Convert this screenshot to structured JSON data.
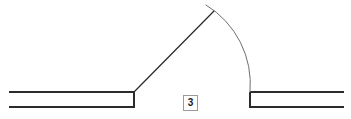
{
  "drawing": {
    "title": "Angular dimension detail",
    "canvas": {
      "width": 351,
      "height": 119,
      "background": "#ffffff"
    },
    "stroke_colors": {
      "outline": "#2b2b2b",
      "arc": "#6e6e6e",
      "label_border": "#9a9a9a",
      "label_text": "#1a1a1a"
    },
    "labels": [
      {
        "id": "angle-dimension",
        "text": "3",
        "x": 183,
        "y": 95,
        "w": 15,
        "h": 16
      }
    ],
    "geometry": {
      "left_band": {
        "name": "left-horizontal-band",
        "top_line": {
          "x1": 9,
          "y1": 92,
          "x2": 134,
          "y2": 92
        },
        "bottom_line": {
          "x1": 9,
          "y1": 107,
          "x2": 134,
          "y2": 107
        },
        "end_cap": {
          "x1": 134,
          "y1": 92,
          "x2": 134,
          "y2": 107
        }
      },
      "right_band": {
        "name": "right-horizontal-band",
        "top_line": {
          "x1": 250,
          "y1": 92,
          "x2": 344,
          "y2": 92
        },
        "bottom_line": {
          "x1": 250,
          "y1": 107,
          "x2": 344,
          "y2": 107
        },
        "end_cap": {
          "x1": 250,
          "y1": 92,
          "x2": 250,
          "y2": 107
        }
      },
      "diagonal_leg": {
        "name": "inclined-leg-line",
        "x1": 134,
        "y1": 92,
        "x2": 214,
        "y2": 11
      },
      "dimension_arc": {
        "name": "angular-dimension-arc",
        "start_x": 206,
        "start_y": 5,
        "end_x": 250,
        "end_y": 92,
        "radius": 92,
        "sweep": 1,
        "large_arc": 0
      }
    }
  }
}
